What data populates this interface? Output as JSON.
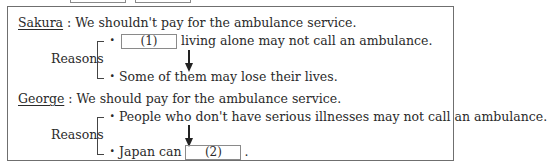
{
  "top_partial_boxes": [
    {
      "left": 70,
      "width": 54
    },
    {
      "left": 135,
      "width": 54
    }
  ],
  "sakura": {
    "speaker": "Sakura",
    "statement": " : We shouldn't pay for the ambulance service.",
    "reasons_label": "Reasons",
    "reason1": {
      "bullet": "・",
      "blank_label": "(1)",
      "text_after": " living alone may not call an ambulance."
    },
    "reason2": {
      "bullet": "・",
      "text": "Some of them may lose their lives."
    }
  },
  "george": {
    "speaker": "George",
    "statement": " : We should pay for the ambulance service.",
    "reasons_label": "Reasons",
    "reason1": {
      "bullet": "・",
      "text": "People who don't have serious illnesses may not call an ambulance."
    },
    "reason2": {
      "bullet": "・",
      "text_before": "Japan can ",
      "blank_label": "(2)",
      "text_after": "."
    }
  }
}
